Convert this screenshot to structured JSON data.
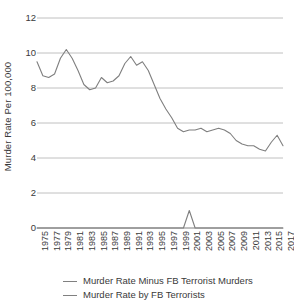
{
  "chart_data": {
    "type": "line",
    "title": "",
    "subtitle": "",
    "xlabel": "",
    "ylabel": "Murder Rate Per 100,000",
    "ylim": [
      0,
      12
    ],
    "xlim": [
      1975,
      2017
    ],
    "grid": true,
    "grid_axis": "y",
    "legend_position": "bottom",
    "y_ticks": [
      0,
      2,
      4,
      6,
      8,
      10,
      12
    ],
    "y_tick_labels": [
      "0",
      "2",
      "4",
      "6",
      "8",
      "10",
      "12"
    ],
    "x_tick_labels": [
      "1975",
      "1977",
      "1979",
      "1981",
      "1983",
      "1985",
      "1987",
      "1989",
      "1991",
      "1993",
      "1995",
      "1997",
      "1999",
      "2001",
      "2003",
      "2005",
      "2007",
      "2009",
      "2011",
      "2013",
      "2015",
      "2017"
    ],
    "x": [
      1975,
      1976,
      1977,
      1978,
      1979,
      1980,
      1981,
      1982,
      1983,
      1984,
      1985,
      1986,
      1987,
      1988,
      1989,
      1990,
      1991,
      1992,
      1993,
      1994,
      1995,
      1996,
      1997,
      1998,
      1999,
      2000,
      2001,
      2002,
      2003,
      2004,
      2005,
      2006,
      2007,
      2008,
      2009,
      2010,
      2011,
      2012,
      2013,
      2014,
      2015,
      2016,
      2017
    ],
    "series": [
      {
        "name": "Murder Rate Minus FB Terrorist Murders",
        "color": "#7f7f7f",
        "values": [
          9.5,
          8.7,
          8.6,
          8.8,
          9.7,
          10.2,
          9.7,
          9.0,
          8.2,
          7.9,
          8.0,
          8.6,
          8.3,
          8.4,
          8.7,
          9.4,
          9.8,
          9.3,
          9.5,
          9.0,
          8.2,
          7.4,
          6.8,
          6.3,
          5.7,
          5.5,
          5.6,
          5.6,
          5.7,
          5.5,
          5.6,
          5.7,
          5.6,
          5.4,
          5.0,
          4.8,
          4.7,
          4.7,
          4.5,
          4.4,
          4.9,
          5.3,
          4.7
        ]
      },
      {
        "name": "Murder Rate by FB Terrorists",
        "color": "#7f7f7f",
        "values": [
          0,
          0,
          0,
          0,
          0,
          0,
          0,
          0,
          0,
          0,
          0,
          0,
          0,
          0,
          0,
          0,
          0,
          0,
          0,
          0,
          0,
          0,
          0,
          0,
          0,
          0,
          1.0,
          0,
          0,
          0,
          0,
          0,
          0,
          0,
          0,
          0,
          0,
          0,
          0,
          0,
          0,
          0,
          0
        ]
      }
    ]
  },
  "legend": {
    "entries": [
      {
        "label": "Murder Rate Minus FB Terrorist Murders"
      },
      {
        "label": "Murder Rate by FB Terrorists"
      }
    ]
  },
  "axis": {
    "y_title": "Murder Rate Per 100,000"
  },
  "style": {
    "grid_color": "#b0b0b0",
    "axis_color": "#808080",
    "line_color": "#6e6e6e",
    "text_color": "#3a3a3a",
    "background": "#ffffff"
  }
}
